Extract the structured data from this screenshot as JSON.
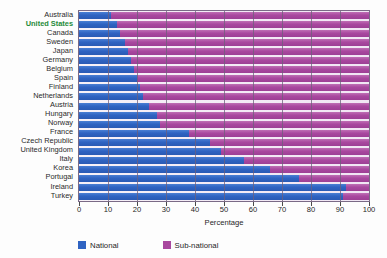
{
  "chart_data": {
    "type": "bar",
    "orientation": "horizontal",
    "stacked": true,
    "title": "",
    "xlabel": "Percentage",
    "ylabel": "",
    "xlim": [
      0,
      100
    ],
    "xticks": [
      0,
      10,
      20,
      30,
      40,
      50,
      60,
      70,
      80,
      90,
      100
    ],
    "grid": true,
    "legend_position": "bottom",
    "categories": [
      "Australia",
      "United States",
      "Canada",
      "Sweden",
      "Japan",
      "Germany",
      "Belgium",
      "Spain",
      "Finland",
      "Netherlands",
      "Austria",
      "Hungary",
      "Norway",
      "France",
      "Czech Republic",
      "United Kingdom",
      "Italy",
      "Korea",
      "Portugal",
      "Ireland",
      "Turkey"
    ],
    "highlight_category": "United States",
    "highlight_color": "#1f8b3a",
    "series": [
      {
        "name": "National",
        "color": "#2f63c2",
        "values": [
          11,
          13,
          14,
          16,
          17,
          18,
          19,
          20,
          21,
          22,
          24,
          27,
          28,
          38,
          45,
          49,
          57,
          66,
          76,
          92,
          91
        ]
      },
      {
        "name": "Sub-national",
        "color": "#a9489f",
        "values": [
          89,
          87,
          86,
          84,
          83,
          82,
          81,
          80,
          79,
          78,
          76,
          73,
          72,
          62,
          55,
          51,
          43,
          34,
          24,
          8,
          9
        ]
      }
    ]
  },
  "legend": {
    "items": [
      {
        "label": "National",
        "color": "#2f63c2",
        "swatch": "legend-swatch-national"
      },
      {
        "label": "Sub-national",
        "color": "#a9489f",
        "swatch": "legend-swatch-subnational"
      }
    ]
  },
  "axis": {
    "x_title": "Percentage"
  }
}
